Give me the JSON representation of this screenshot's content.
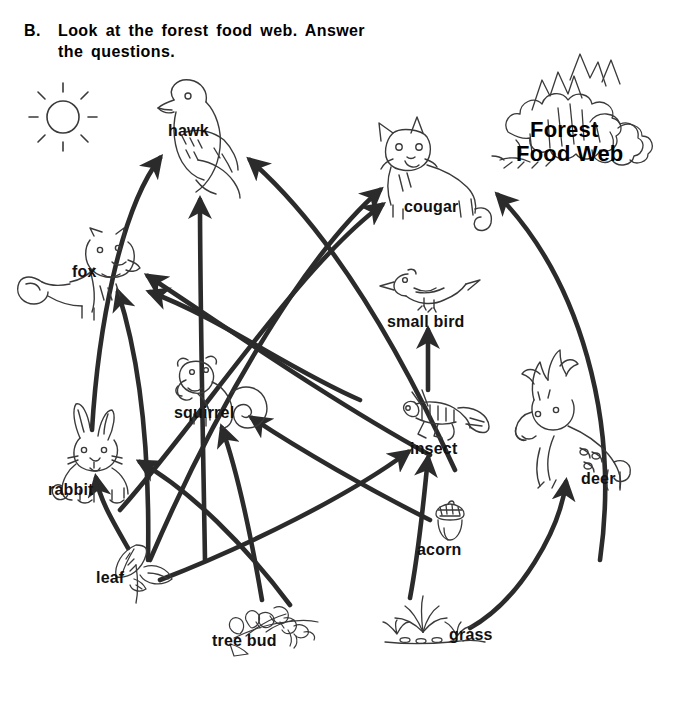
{
  "header": {
    "item_letter": "B.",
    "line1": "Look at the forest food web.  Answer",
    "line2": "the questions."
  },
  "title_block": {
    "icon": "forest-trees-icon",
    "line1": "Forest",
    "line2": "Food Web"
  },
  "decorations": [
    {
      "name": "sun-icon",
      "label": "sun",
      "x": 28,
      "y": 82,
      "w": 70,
      "h": 70
    }
  ],
  "colors": {
    "background": "#ffffff",
    "ink": "#1a1a1a",
    "arrow": "#2b2b2b",
    "line_art": "#3a3a3a"
  },
  "diagram": {
    "type": "food-web",
    "title": "Forest Food Web",
    "nodes": [
      {
        "id": "hawk",
        "label": "hawk",
        "icon": "hawk-icon",
        "label_x": 168,
        "label_y": 122,
        "art_x": 140,
        "art_y": 80,
        "art_w": 120,
        "art_h": 110
      },
      {
        "id": "cougar",
        "label": "cougar",
        "icon": "cougar-icon",
        "label_x": 404,
        "label_y": 198,
        "art_x": 365,
        "art_y": 118,
        "art_w": 130,
        "art_h": 100
      },
      {
        "id": "fox",
        "label": "fox",
        "icon": "fox-icon",
        "label_x": 72,
        "label_y": 263,
        "art_x": 18,
        "art_y": 228,
        "art_w": 130,
        "art_h": 95
      },
      {
        "id": "small bird",
        "label": "small bird",
        "icon": "small-bird-icon",
        "label_x": 387,
        "label_y": 313,
        "art_x": 380,
        "art_y": 268,
        "art_w": 100,
        "art_h": 50
      },
      {
        "id": "squirrel",
        "label": "squirrel",
        "icon": "squirrel-icon",
        "label_x": 174,
        "label_y": 404,
        "art_x": 163,
        "art_y": 355,
        "art_w": 110,
        "art_h": 72
      },
      {
        "id": "insect",
        "label": "insect",
        "icon": "grasshopper-icon",
        "label_x": 410,
        "label_y": 440,
        "art_x": 398,
        "art_y": 388,
        "art_w": 100,
        "art_h": 56
      },
      {
        "id": "deer",
        "label": "deer",
        "icon": "deer-icon",
        "label_x": 581,
        "label_y": 470,
        "art_x": 512,
        "art_y": 355,
        "art_w": 140,
        "art_h": 125
      },
      {
        "id": "rabbit",
        "label": "rabbit",
        "icon": "rabbit-icon",
        "label_x": 48,
        "label_y": 481,
        "art_x": 52,
        "art_y": 405,
        "art_w": 95,
        "art_h": 85
      },
      {
        "id": "acorn",
        "label": "acorn",
        "icon": "acorn-icon",
        "label_x": 417,
        "label_y": 541,
        "art_x": 428,
        "art_y": 500,
        "art_w": 44,
        "art_h": 44
      },
      {
        "id": "leaf",
        "label": "leaf",
        "icon": "leaf-icon",
        "label_x": 96,
        "label_y": 569,
        "art_x": 108,
        "art_y": 543,
        "art_w": 70,
        "art_h": 62
      },
      {
        "id": "tree bud",
        "label": "tree bud",
        "icon": "tree-bud-icon",
        "label_x": 212,
        "label_y": 632,
        "art_x": 228,
        "art_y": 594,
        "art_w": 90,
        "art_h": 58
      },
      {
        "id": "grass",
        "label": "grass",
        "icon": "grass-icon",
        "label_x": 449,
        "label_y": 626,
        "art_x": 385,
        "art_y": 596,
        "art_w": 100,
        "art_h": 48
      }
    ],
    "links": [
      {
        "from": "rabbit",
        "to": "hawk",
        "path": "M 92 430 C 98 330 120 210 160 158"
      },
      {
        "from": "squirrel",
        "to": "hawk",
        "path": "M 205 560 C 203 440 200 300 200 200"
      },
      {
        "from": "insect",
        "to": "hawk",
        "path": "M 455 470 C 400 350 330 230 250 160"
      },
      {
        "from": "squirrel",
        "to": "cougar",
        "path": "M 150 560 C 210 420 300 260 380 190"
      },
      {
        "from": "rabbit",
        "to": "cougar",
        "path": "M 120 510 C 200 420 300 265 382 205"
      },
      {
        "from": "deer",
        "to": "cougar",
        "path": "M 600 560 C 620 420 580 280 498 195"
      },
      {
        "from": "leaf",
        "to": "fox",
        "path": "M 148 560 C 150 450 140 360 118 292"
      },
      {
        "from": "squirrel",
        "to": "fox",
        "path": "M 360 400 C 290 370 220 318 150 292"
      },
      {
        "from": "insect",
        "to": "fox",
        "path": "M 430 455 C 330 400 230 330 148 276"
      },
      {
        "from": "insect",
        "to": "small bird",
        "path": "M 428 390 L 428 330"
      },
      {
        "from": "acorn",
        "to": "squirrel",
        "path": "M 430 520 C 370 490 300 450 252 418"
      },
      {
        "from": "tree bud",
        "to": "squirrel",
        "path": "M 262 600 C 250 530 235 465 222 428"
      },
      {
        "from": "leaf",
        "to": "rabbit",
        "path": "M 128 548 C 112 520 100 500 96 478"
      },
      {
        "from": "tree bud",
        "to": "rabbit",
        "path": "M 290 605 C 245 545 190 490 140 462"
      },
      {
        "from": "leaf",
        "to": "insect",
        "path": "M 160 580 C 250 545 350 495 408 452"
      },
      {
        "from": "grass",
        "to": "insect",
        "path": "M 410 598 C 420 545 424 495 428 458"
      },
      {
        "from": "grass",
        "to": "deer",
        "path": "M 470 628 C 520 600 560 530 566 482"
      }
    ]
  }
}
